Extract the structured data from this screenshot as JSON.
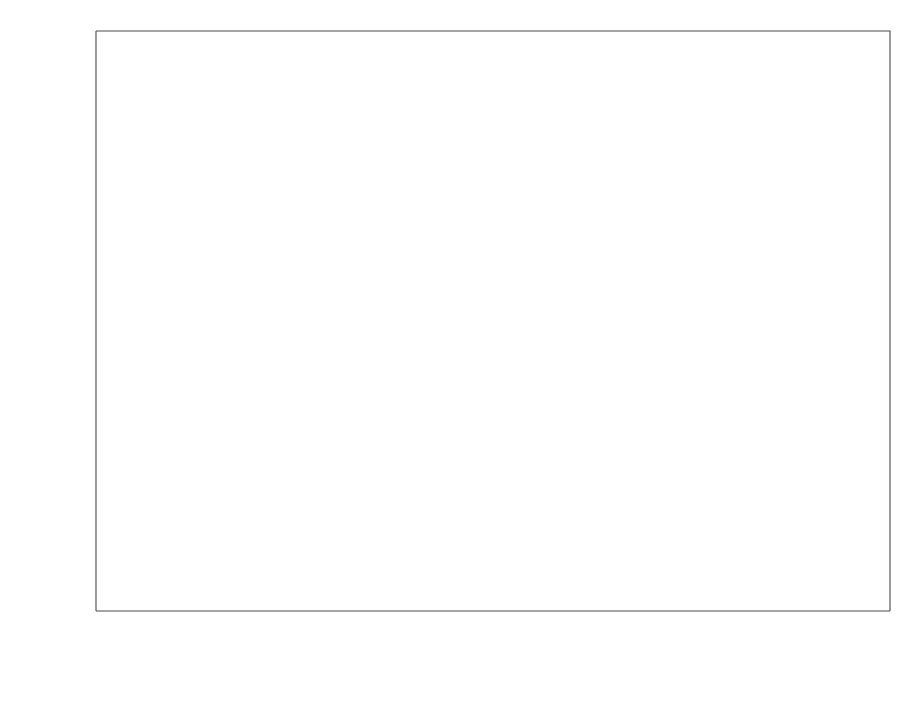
{
  "chart_data": {
    "type": "scatter",
    "title": "",
    "xlabel": "usage time (#bytes transferred)",
    "ylabel": "cumulative failures",
    "xlim": [
      -2000000000.0,
      77000000000.0
    ],
    "ylim": [
      -180,
      4820
    ],
    "grid": false,
    "legend_position": "center-right",
    "xticks": [
      0,
      20000000000,
      40000000000,
      60000000000
    ],
    "xtick_labels": [
      "0",
      "2*10^10",
      "4*10^10",
      "6*10^10"
    ],
    "yticks": [
      0,
      1000,
      2000,
      3000,
      4000
    ],
    "ytick_labels": [
      "0",
      "1000",
      "2000",
      "3000",
      "4000"
    ],
    "series": [
      {
        "name": "Actual data",
        "marker": "dot",
        "x": [
          0,
          3100000000,
          6800000000,
          11200000000,
          14800000000,
          18700000000,
          22700000000,
          25400000000,
          28100000000,
          31900000000,
          35400000000,
          38800000000,
          42400000000,
          46000000000,
          49200000000,
          52100000000,
          55100000000,
          58800000000,
          62900000000,
          66500000000,
          72300000000,
          75200000000
        ],
        "y": [
          0,
          390,
          700,
          1320,
          1620,
          2140,
          2520,
          2750,
          2880,
          2970,
          3060,
          3580,
          3690,
          3810,
          3880,
          3960,
          4000,
          4060,
          4130,
          4230,
          4340,
          4420
        ]
      },
      {
        "name": "GO Model",
        "marker": "line",
        "model": "m(t) = N (1 - exp(-b*t))",
        "N": 5228,
        "b": 2.745e-11
      }
    ]
  },
  "legend": {
    "entries": [
      {
        "label": "Actual data",
        "marker": "dot"
      },
      {
        "label": "GO Model",
        "marker": "line"
      }
    ]
  },
  "summary": {
    "heading": "Modeling Result Summary:",
    "divider_top": "==============",
    "equation": "m(t) = N (1 - exp(-b*t))",
    "param_n": "N= 5228",
    "param_b": "b= 2.745e-11",
    "divider_bottom": "==============",
    "failure_rate": "failure rate: 1.847e-08",
    "mtbf": "MTBF: 54130063",
    "ssq": "SSQ(residuals): 209002"
  },
  "geometry": {
    "plot_left": 96,
    "plot_right": 890,
    "plot_top": 31,
    "plot_bottom": 611,
    "x_zero_px": 126,
    "x_per_2e10_px": 197,
    "y_zero_px": 588,
    "y_per_1000_px": 122,
    "legend_box": {
      "x": 613,
      "y": 254,
      "w": 196,
      "h": 53
    },
    "summary_anchor_x": 806,
    "summary_top_y": 385,
    "summary_line_height": 19.5
  }
}
